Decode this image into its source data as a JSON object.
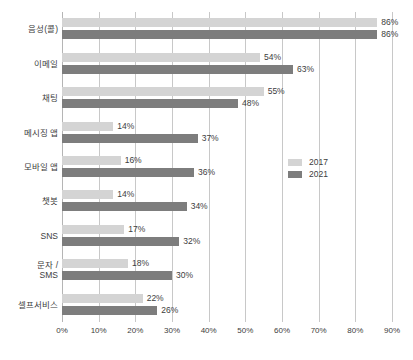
{
  "chart_data": {
    "type": "bar",
    "orientation": "horizontal",
    "title": "",
    "xlabel": "",
    "ylabel": "",
    "xlim": [
      0,
      90
    ],
    "xticks": [
      "0%",
      "10%",
      "20%",
      "30%",
      "40%",
      "50%",
      "60%",
      "70%",
      "80%",
      "90%"
    ],
    "grid": true,
    "legend_position": "center-right",
    "categories": [
      "음성(콜)",
      "이메일",
      "채팅",
      "메시징 앱",
      "모바일 앱",
      "챗봇",
      "SNS",
      "문자 /\nSMS",
      "셀프서비스"
    ],
    "series": [
      {
        "name": "2017",
        "color": "#d4d4d4",
        "values": [
          86,
          54,
          55,
          14,
          16,
          14,
          17,
          18,
          22
        ],
        "labels": [
          "86%",
          "54%",
          "55%",
          "14%",
          "16%",
          "14%",
          "17%",
          "18%",
          "22%"
        ]
      },
      {
        "name": "2021",
        "color": "#7d7d7d",
        "values": [
          86,
          63,
          48,
          37,
          36,
          34,
          32,
          30,
          26
        ],
        "labels": [
          "86%",
          "63%",
          "48%",
          "37%",
          "36%",
          "34%",
          "32%",
          "30%",
          "26%"
        ]
      }
    ]
  },
  "legend": {
    "items": [
      {
        "label": "2017",
        "color": "#d4d4d4"
      },
      {
        "label": "2021",
        "color": "#7d7d7d"
      }
    ]
  }
}
